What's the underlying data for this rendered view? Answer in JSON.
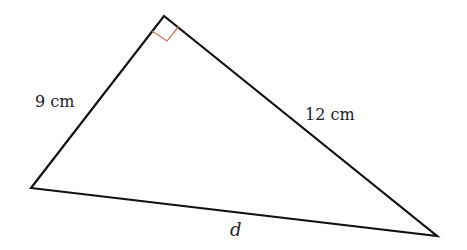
{
  "diagram": {
    "type": "right-triangle",
    "vertices": {
      "left": [
        31,
        188
      ],
      "top": [
        164,
        16
      ],
      "right": [
        437,
        236
      ]
    },
    "right_angle_at": "top",
    "right_angle_marker_color": "#e07050",
    "stroke_color": "#111111",
    "labels": {
      "left_side": "9 cm",
      "right_side": "12 cm",
      "bottom_side": "d"
    }
  }
}
